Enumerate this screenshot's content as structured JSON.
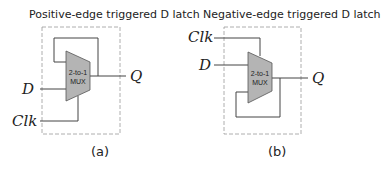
{
  "figure": {
    "panel_a": {
      "title": "Positive-edge triggered D latch",
      "caption": "(a)",
      "mux_label_line1": "2-to-1",
      "mux_label_line2": "MUX",
      "inputs": {
        "d": "D",
        "clk": "Clk"
      },
      "output": "Q"
    },
    "panel_b": {
      "title": "Negative-edge triggered D latch",
      "caption": "(b)",
      "mux_label_line1": "2-to-1",
      "mux_label_line2": "MUX",
      "inputs": {
        "d": "D",
        "clk": "Clk"
      },
      "output": "Q"
    },
    "colors": {
      "mux_fill": "#b4b4b4",
      "wire": "#444444",
      "dashed_box": "#9a9a9a"
    }
  }
}
